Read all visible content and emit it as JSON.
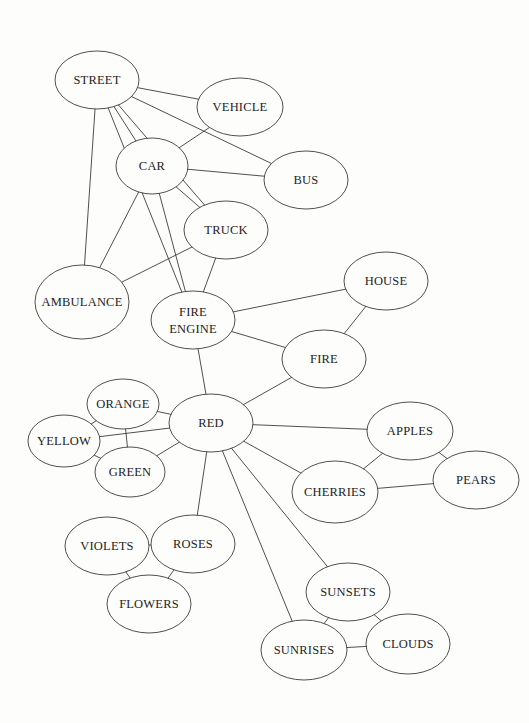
{
  "diagram": {
    "type": "semantic-network",
    "background": "#fdfdfc",
    "line_color": "#3c3c3c",
    "nodes": [
      {
        "id": "street",
        "label": [
          "STREET"
        ],
        "cx": 97,
        "cy": 80,
        "rx": 42,
        "ry": 29
      },
      {
        "id": "vehicle",
        "label": [
          "VEHICLE"
        ],
        "cx": 240,
        "cy": 107,
        "rx": 43,
        "ry": 29
      },
      {
        "id": "car",
        "label": [
          "CAR"
        ],
        "cx": 152,
        "cy": 166,
        "rx": 36,
        "ry": 28
      },
      {
        "id": "bus",
        "label": [
          "BUS"
        ],
        "cx": 306,
        "cy": 180,
        "rx": 42,
        "ry": 29
      },
      {
        "id": "truck",
        "label": [
          "TRUCK"
        ],
        "cx": 226,
        "cy": 230,
        "rx": 42,
        "ry": 29
      },
      {
        "id": "ambulance",
        "label": [
          "AMBULANCE"
        ],
        "cx": 82,
        "cy": 302,
        "rx": 47,
        "ry": 37
      },
      {
        "id": "fire-engine",
        "label": [
          "FIRE",
          "ENGINE"
        ],
        "cx": 193,
        "cy": 320,
        "rx": 42,
        "ry": 29
      },
      {
        "id": "house",
        "label": [
          "HOUSE"
        ],
        "cx": 386,
        "cy": 281,
        "rx": 42,
        "ry": 29
      },
      {
        "id": "fire",
        "label": [
          "FIRE"
        ],
        "cx": 324,
        "cy": 359,
        "rx": 42,
        "ry": 29
      },
      {
        "id": "red",
        "label": [
          "RED"
        ],
        "cx": 211,
        "cy": 423,
        "rx": 42,
        "ry": 29
      },
      {
        "id": "orange",
        "label": [
          "ORANGE"
        ],
        "cx": 123,
        "cy": 404,
        "rx": 36,
        "ry": 25
      },
      {
        "id": "yellow",
        "label": [
          "YELLOW"
        ],
        "cx": 64,
        "cy": 441,
        "rx": 36,
        "ry": 26
      },
      {
        "id": "green",
        "label": [
          "GREEN"
        ],
        "cx": 130,
        "cy": 472,
        "rx": 35,
        "ry": 25
      },
      {
        "id": "apples",
        "label": [
          "APPLES"
        ],
        "cx": 410,
        "cy": 431,
        "rx": 43,
        "ry": 29
      },
      {
        "id": "cherries",
        "label": [
          "CHERRIES"
        ],
        "cx": 335,
        "cy": 492,
        "rx": 43,
        "ry": 31
      },
      {
        "id": "pears",
        "label": [
          "PEARS"
        ],
        "cx": 476,
        "cy": 480,
        "rx": 43,
        "ry": 29
      },
      {
        "id": "violets",
        "label": [
          "VIOLETS"
        ],
        "cx": 107,
        "cy": 546,
        "rx": 42,
        "ry": 29
      },
      {
        "id": "roses",
        "label": [
          "ROSES"
        ],
        "cx": 193,
        "cy": 544,
        "rx": 42,
        "ry": 29
      },
      {
        "id": "flowers",
        "label": [
          "FLOWERS"
        ],
        "cx": 149,
        "cy": 604,
        "rx": 42,
        "ry": 29
      },
      {
        "id": "sunsets",
        "label": [
          "SUNSETS"
        ],
        "cx": 348,
        "cy": 592,
        "rx": 42,
        "ry": 29
      },
      {
        "id": "sunrises",
        "label": [
          "SUNRISES"
        ],
        "cx": 304,
        "cy": 650,
        "rx": 43,
        "ry": 30
      },
      {
        "id": "clouds",
        "label": [
          "CLOUDS"
        ],
        "cx": 408,
        "cy": 644,
        "rx": 42,
        "ry": 30
      }
    ],
    "edges": [
      [
        "street",
        "vehicle"
      ],
      [
        "street",
        "car"
      ],
      [
        "street",
        "bus"
      ],
      [
        "street",
        "truck"
      ],
      [
        "street",
        "ambulance"
      ],
      [
        "street",
        "fire-engine"
      ],
      [
        "car",
        "vehicle"
      ],
      [
        "car",
        "bus"
      ],
      [
        "car",
        "truck"
      ],
      [
        "car",
        "ambulance"
      ],
      [
        "car",
        "fire-engine"
      ],
      [
        "truck",
        "ambulance"
      ],
      [
        "truck",
        "fire-engine"
      ],
      [
        "fire-engine",
        "house"
      ],
      [
        "fire-engine",
        "fire"
      ],
      [
        "fire-engine",
        "red"
      ],
      [
        "house",
        "fire"
      ],
      [
        "fire",
        "red"
      ],
      [
        "red",
        "orange"
      ],
      [
        "red",
        "yellow"
      ],
      [
        "red",
        "green"
      ],
      [
        "orange",
        "yellow"
      ],
      [
        "orange",
        "green"
      ],
      [
        "yellow",
        "green"
      ],
      [
        "red",
        "apples"
      ],
      [
        "red",
        "cherries"
      ],
      [
        "apples",
        "cherries"
      ],
      [
        "apples",
        "pears"
      ],
      [
        "cherries",
        "pears"
      ],
      [
        "red",
        "roses"
      ],
      [
        "roses",
        "violets"
      ],
      [
        "roses",
        "flowers"
      ],
      [
        "violets",
        "flowers"
      ],
      [
        "red",
        "sunsets"
      ],
      [
        "red",
        "sunrises"
      ],
      [
        "sunsets",
        "sunrises"
      ],
      [
        "sunsets",
        "clouds"
      ],
      [
        "sunrises",
        "clouds"
      ]
    ]
  }
}
